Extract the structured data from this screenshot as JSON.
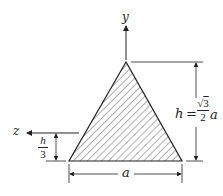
{
  "figure": {
    "type": "equilateral-triangle-cross-section",
    "axes": {
      "y_label": "y",
      "z_label": "z"
    },
    "dimensions": {
      "base_label": "a",
      "height_label_lhs": "h",
      "height_label_eq": "=",
      "height_sqrt_num": "3",
      "height_den": "2",
      "height_var": "a",
      "centroid_offset_num": "h",
      "centroid_offset_den": "3"
    },
    "colors": {
      "line": "#222222",
      "hatch": "#333333",
      "background": "#ffffff"
    }
  }
}
